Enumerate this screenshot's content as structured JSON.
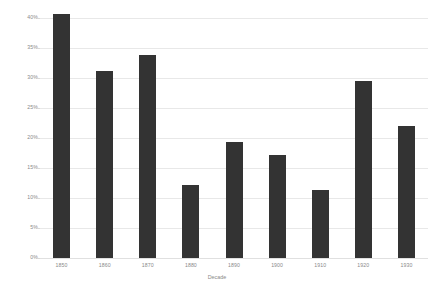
{
  "chart_data": {
    "type": "bar",
    "title": "",
    "subtitle": "",
    "xlabel": "Decade",
    "ylabel": "",
    "categories": [
      "1850",
      "1860",
      "1870",
      "1880",
      "1890",
      "1900",
      "1910",
      "1920",
      "1930"
    ],
    "values": [
      40.7,
      31.1,
      33.9,
      12.1,
      19.3,
      17.2,
      11.3,
      29.5,
      22.0
    ],
    "value_format": "percent",
    "ylim": [
      0,
      42
    ],
    "yticks": [
      0,
      5,
      10,
      15,
      20,
      25,
      30,
      35,
      40
    ],
    "ytick_labels": [
      "0%",
      "5%",
      "10%",
      "15%",
      "20%",
      "25%",
      "30%",
      "35%",
      "40%"
    ],
    "grid": true,
    "grid_axis": "y",
    "legend": false,
    "legend_position": "none",
    "bar_color": "#333333",
    "grid_color": "#e8e8e8",
    "text_color": "#8a8a8a",
    "background_color": "#ffffff"
  }
}
